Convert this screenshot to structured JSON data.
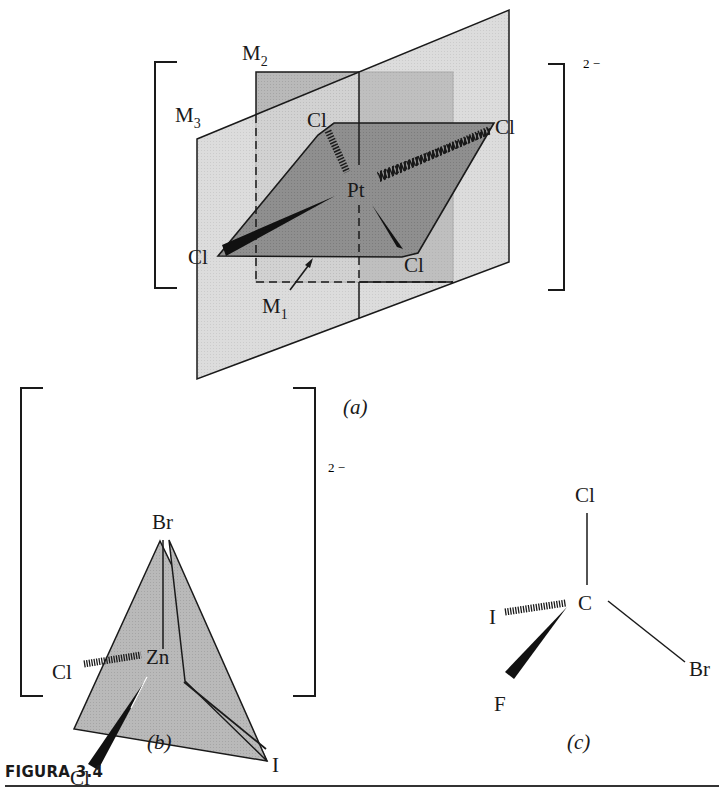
{
  "figure": {
    "title": "FIGURA 3.4",
    "panels": [
      {
        "id": "a",
        "caption": "(a)",
        "charge": "2 −",
        "central_atom": "Pt",
        "ligands": [
          "Cl",
          "Cl",
          "Cl",
          "Cl"
        ],
        "planes": [
          {
            "label": "M",
            "subscript": "1"
          },
          {
            "label": "M",
            "subscript": "2"
          },
          {
            "label": "M",
            "subscript": "3"
          }
        ]
      },
      {
        "id": "b",
        "caption": "(b)",
        "charge": "2 −",
        "central_atom": "Zn",
        "ligands": [
          "Br",
          "Cl",
          "Cl",
          "I"
        ]
      },
      {
        "id": "c",
        "caption": "(c)",
        "central_atom": "C",
        "ligands": [
          "Cl",
          "I",
          "F",
          "Br"
        ]
      }
    ]
  },
  "colors": {
    "light_plane": "#d2d2d2",
    "mid_plane": "#b4b4b4",
    "dark_plane": "#8a8a8a",
    "line": "#1a1a1a"
  }
}
